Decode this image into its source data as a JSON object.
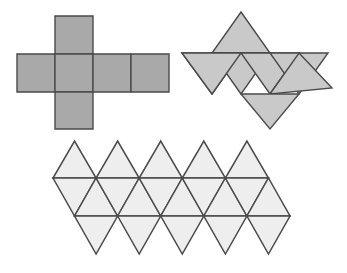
{
  "page": {
    "background_color": "#ffffff",
    "width": 347,
    "height": 273
  },
  "chart_data": {
    "type": "diagram",
    "subtitle": "",
    "xlabel": "",
    "ylabel": "",
    "grid": false,
    "legend": false,
    "figures": [
      {
        "id": "cube-net",
        "name": "Cube Net",
        "shape_kind": "net",
        "polyhedron": "cube",
        "face_shape": "square",
        "face_count": 6,
        "fill_color": "#a9a9a9",
        "stroke_color": "#4a4a4a",
        "stroke_width": 1.4,
        "bounds": [
          17,
          16,
          170,
          129
        ],
        "layout": "cross",
        "faces": [
          {
            "label": "top-square",
            "points": "55,16 93,16 93,54 55,54"
          },
          {
            "label": "left-square",
            "points": "17,54 55,54 55,92 17,92"
          },
          {
            "label": "center-square",
            "points": "55,54 93,54 93,92 55,92"
          },
          {
            "label": "right-square",
            "points": "93,54 131,54 131,92 93,92"
          },
          {
            "label": "far-right-square",
            "points": "131,54 169,54 169,92 131,92"
          },
          {
            "label": "bottom-square",
            "points": "55,92 93,92 93,129 55,129"
          }
        ]
      },
      {
        "id": "octahedron-net",
        "name": "Octahedron Net",
        "shape_kind": "net",
        "polyhedron": "octahedron",
        "face_shape": "equilateral-triangle",
        "face_count": 8,
        "fill_color": "#c9c9c9",
        "stroke_color": "#4a4a4a",
        "stroke_width": 1.4,
        "bounds": [
          182,
          12,
          332,
          129
        ],
        "layout": "strip-with-flaps",
        "faces": [
          {
            "label": "top-flap-up",
            "points": "241,12 270,53 212,53"
          },
          {
            "label": "strip-down-1",
            "points": "182,53 241,53 212,94"
          },
          {
            "label": "strip-up-1",
            "points": "212,53 270,53 241,94"
          },
          {
            "label": "strip-down-2",
            "points": "241,53 299,53 270,94"
          },
          {
            "label": "strip-up-2",
            "points": "270,53 328,53 299,94"
          },
          {
            "label": "strip-down-3",
            "points": "299,53 332,88 270,94"
          },
          {
            "label": "left-flap",
            "points": "182,53 212,94 241,53"
          },
          {
            "label": "bottom-flap-down",
            "points": "241,94 299,94 270,129"
          }
        ]
      },
      {
        "id": "icosahedron-net",
        "name": "Icosahedron Net",
        "shape_kind": "net",
        "polyhedron": "icosahedron",
        "face_shape": "equilateral-triangle",
        "face_count": 20,
        "fill_color": "#eeeeee",
        "stroke_color": "#4a4a4a",
        "stroke_width": 1.5,
        "bounds": [
          53,
          141,
          290,
          254
        ],
        "layout": "three-bands",
        "band_rows": 3,
        "columns": 5,
        "apex_top_y": 141,
        "mid_line_1_y": 178,
        "mid_line_2_y": 216,
        "apex_bottom_y": 254
      }
    ]
  }
}
